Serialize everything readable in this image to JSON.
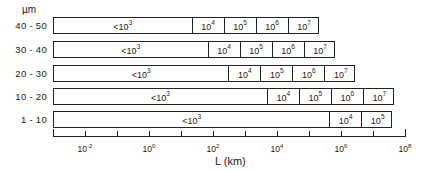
{
  "chart_data": {
    "type": "bar",
    "subtype": "stacked-horizontal-log-interval",
    "title": "",
    "xlabel": "L (km)",
    "ylabel": "µm",
    "xscale": "log",
    "xlim_exponents": [
      -3,
      8
    ],
    "x_tick_labels": [
      "10^-2",
      "10^0",
      "10^2",
      "10^4",
      "10^6",
      "10^8"
    ],
    "x_tick_exponents": [
      -3,
      -2,
      -1,
      0,
      1,
      2,
      3,
      4,
      5,
      6,
      7,
      8
    ],
    "categories": [
      "40 - 50",
      "30 - 40",
      "20 - 30",
      "10 - 20",
      "1 - 10"
    ],
    "rows": [
      {
        "label": "40 - 50",
        "segments": [
          {
            "text": "<10",
            "exp": "3",
            "from": -3.0,
            "to": 1.3
          },
          {
            "text": "10",
            "exp": "4",
            "from": 1.3,
            "to": 2.3
          },
          {
            "text": "10",
            "exp": "5",
            "from": 2.3,
            "to": 3.3
          },
          {
            "text": "10",
            "exp": "6",
            "from": 3.3,
            "to": 4.3
          },
          {
            "text": "10",
            "exp": "7",
            "from": 4.3,
            "to": 5.3
          }
        ]
      },
      {
        "label": "30 - 40",
        "segments": [
          {
            "text": "<10",
            "exp": "3",
            "from": -3.0,
            "to": 1.8
          },
          {
            "text": "10",
            "exp": "4",
            "from": 1.8,
            "to": 2.8
          },
          {
            "text": "10",
            "exp": "5",
            "from": 2.8,
            "to": 3.8
          },
          {
            "text": "10",
            "exp": "6",
            "from": 3.8,
            "to": 4.8
          },
          {
            "text": "10",
            "exp": "7",
            "from": 4.8,
            "to": 5.8
          }
        ]
      },
      {
        "label": "20 - 30",
        "segments": [
          {
            "text": "<10",
            "exp": "3",
            "from": -3.0,
            "to": 2.45
          },
          {
            "text": "10",
            "exp": "4",
            "from": 2.45,
            "to": 3.45
          },
          {
            "text": "10",
            "exp": "5",
            "from": 3.45,
            "to": 4.45
          },
          {
            "text": "10",
            "exp": "6",
            "from": 4.45,
            "to": 5.45
          },
          {
            "text": "10",
            "exp": "7",
            "from": 5.45,
            "to": 6.45
          }
        ]
      },
      {
        "label": "10 - 20",
        "segments": [
          {
            "text": "<10",
            "exp": "3",
            "from": -3.0,
            "to": 3.65
          },
          {
            "text": "10",
            "exp": "4",
            "from": 3.65,
            "to": 4.65
          },
          {
            "text": "10",
            "exp": "5",
            "from": 4.65,
            "to": 5.65
          },
          {
            "text": "10",
            "exp": "6",
            "from": 5.65,
            "to": 6.65
          },
          {
            "text": "10",
            "exp": "7",
            "from": 6.65,
            "to": 7.65
          }
        ]
      },
      {
        "label": "1 - 10",
        "segments": [
          {
            "text": "<10",
            "exp": "3",
            "from": -3.0,
            "to": 5.6
          },
          {
            "text": "10",
            "exp": "4",
            "from": 5.6,
            "to": 6.6
          },
          {
            "text": "10",
            "exp": "5",
            "from": 6.6,
            "to": 7.6
          }
        ]
      }
    ],
    "grid": false,
    "legend": null
  },
  "axis": {
    "unit_label": "µm",
    "x_title": "L  (km)",
    "labels": [
      {
        "base": "10",
        "exp": "-2",
        "value": -2
      },
      {
        "base": "10",
        "exp": "0",
        "value": 0
      },
      {
        "base": "10",
        "exp": "2",
        "value": 2
      },
      {
        "base": "10",
        "exp": "4",
        "value": 4
      },
      {
        "base": "10",
        "exp": "6",
        "value": 6
      },
      {
        "base": "10",
        "exp": "8",
        "value": 8
      }
    ]
  }
}
